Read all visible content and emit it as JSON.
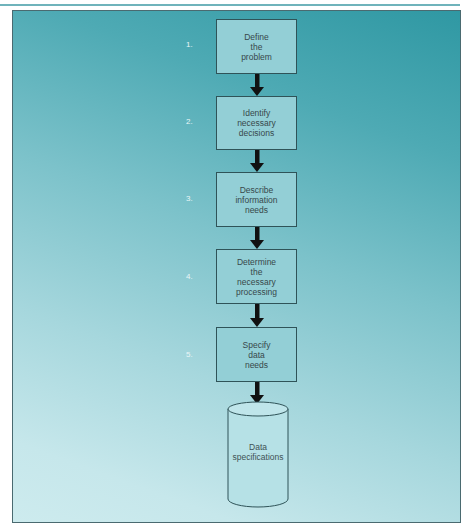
{
  "diagram": {
    "type": "flowchart",
    "colors": {
      "panel_top": "#2f98a3",
      "panel_bottom": "#cdebee",
      "box_fill": "#93cfd6",
      "box_border": "#2f5358",
      "arrow": "#111111",
      "text": "#37484b"
    },
    "steps": [
      {
        "number": "1.",
        "label": "Define\nthe\nproblem"
      },
      {
        "number": "2.",
        "label": "Identify\nnecessary\ndecisions"
      },
      {
        "number": "3.",
        "label": "Describe\ninformation\nneeds"
      },
      {
        "number": "4.",
        "label": "Determine\nthe\nnecessary\nprocessing"
      },
      {
        "number": "5.",
        "label": "Specify\ndata\nneeds"
      }
    ],
    "output": {
      "shape": "cylinder",
      "label": "Data\nspecifications"
    }
  }
}
